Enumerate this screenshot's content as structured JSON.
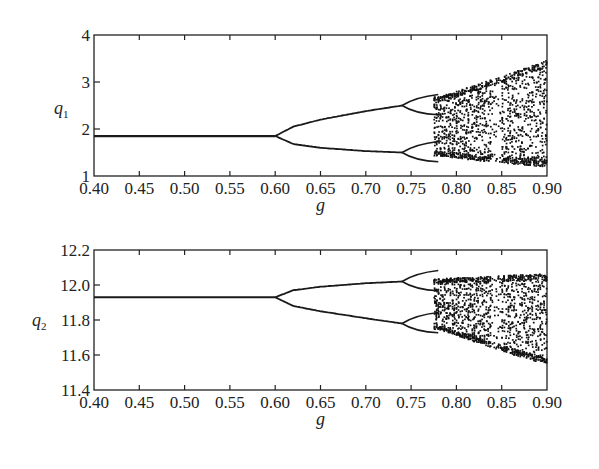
{
  "chart_data": [
    {
      "type": "scatter",
      "title": "",
      "xlabel": "g",
      "ylabel": "q1",
      "xlim": [
        0.4,
        0.9
      ],
      "ylim": [
        1,
        4
      ],
      "xticks": [
        "0.40",
        "0.45",
        "0.50",
        "0.55",
        "0.60",
        "0.65",
        "0.70",
        "0.75",
        "0.80",
        "0.85",
        "0.90"
      ],
      "yticks": [
        "1",
        "2",
        "3",
        "4"
      ],
      "grid": false,
      "legend": null,
      "description": "Bifurcation diagram: single fixed point ~1.85 for g<0.60, period-doubling at g=0.60 into two branches (upper rising to ~2.5, lower falling to ~1.5 at g~0.74), second doubling near g~0.74, chaos from g~0.78 widening to ~1.2-3.5 at g=0.90",
      "series": [
        {
          "name": "fixed_point",
          "x": [
            0.4,
            0.6
          ],
          "y": [
            1.85,
            1.85
          ]
        },
        {
          "name": "upper_branch",
          "x": [
            0.6,
            0.62,
            0.65,
            0.7,
            0.74
          ],
          "y": [
            1.85,
            2.05,
            2.2,
            2.38,
            2.5
          ]
        },
        {
          "name": "lower_branch",
          "x": [
            0.6,
            0.62,
            0.65,
            0.7,
            0.74
          ],
          "y": [
            1.85,
            1.68,
            1.6,
            1.53,
            1.5
          ]
        },
        {
          "name": "chaos_envelope_upper",
          "x": [
            0.78,
            0.82,
            0.86,
            0.9
          ],
          "y": [
            2.7,
            2.95,
            3.2,
            3.5
          ]
        },
        {
          "name": "chaos_envelope_lower",
          "x": [
            0.78,
            0.82,
            0.86,
            0.9
          ],
          "y": [
            1.45,
            1.35,
            1.28,
            1.2
          ]
        }
      ]
    },
    {
      "type": "scatter",
      "title": "",
      "xlabel": "g",
      "ylabel": "q2",
      "xlim": [
        0.4,
        0.9
      ],
      "ylim": [
        11.4,
        12.2
      ],
      "xticks": [
        "0.40",
        "0.45",
        "0.50",
        "0.55",
        "0.60",
        "0.65",
        "0.70",
        "0.75",
        "0.80",
        "0.85",
        "0.90"
      ],
      "yticks": [
        "11.4",
        "11.6",
        "11.8",
        "12.0",
        "12.2"
      ],
      "grid": false,
      "legend": null,
      "description": "Bifurcation diagram: fixed point ~11.93 for g<0.60, bifurcating at g=0.60 into upper (~12.02) and lower (~11.78) branches, second doubling near g~0.74, chaos from g~0.78 spanning ~11.55-12.07 at g=0.90",
      "series": [
        {
          "name": "fixed_point",
          "x": [
            0.4,
            0.6
          ],
          "y": [
            11.93,
            11.93
          ]
        },
        {
          "name": "upper_branch",
          "x": [
            0.6,
            0.62,
            0.65,
            0.7,
            0.74
          ],
          "y": [
            11.93,
            11.97,
            11.99,
            12.01,
            12.02
          ]
        },
        {
          "name": "lower_branch",
          "x": [
            0.6,
            0.62,
            0.65,
            0.7,
            0.74
          ],
          "y": [
            11.93,
            11.88,
            11.85,
            11.81,
            11.78
          ]
        },
        {
          "name": "chaos_envelope_upper",
          "x": [
            0.78,
            0.82,
            0.86,
            0.9
          ],
          "y": [
            12.04,
            12.05,
            12.06,
            12.07
          ]
        },
        {
          "name": "chaos_envelope_lower",
          "x": [
            0.78,
            0.82,
            0.86,
            0.9
          ],
          "y": [
            11.75,
            11.68,
            11.61,
            11.55
          ]
        }
      ]
    }
  ],
  "labels": {
    "top_ylabel": "q",
    "top_ylabel_sub": "1",
    "bottom_ylabel": "q",
    "bottom_ylabel_sub": "2",
    "xlabel": "g"
  }
}
